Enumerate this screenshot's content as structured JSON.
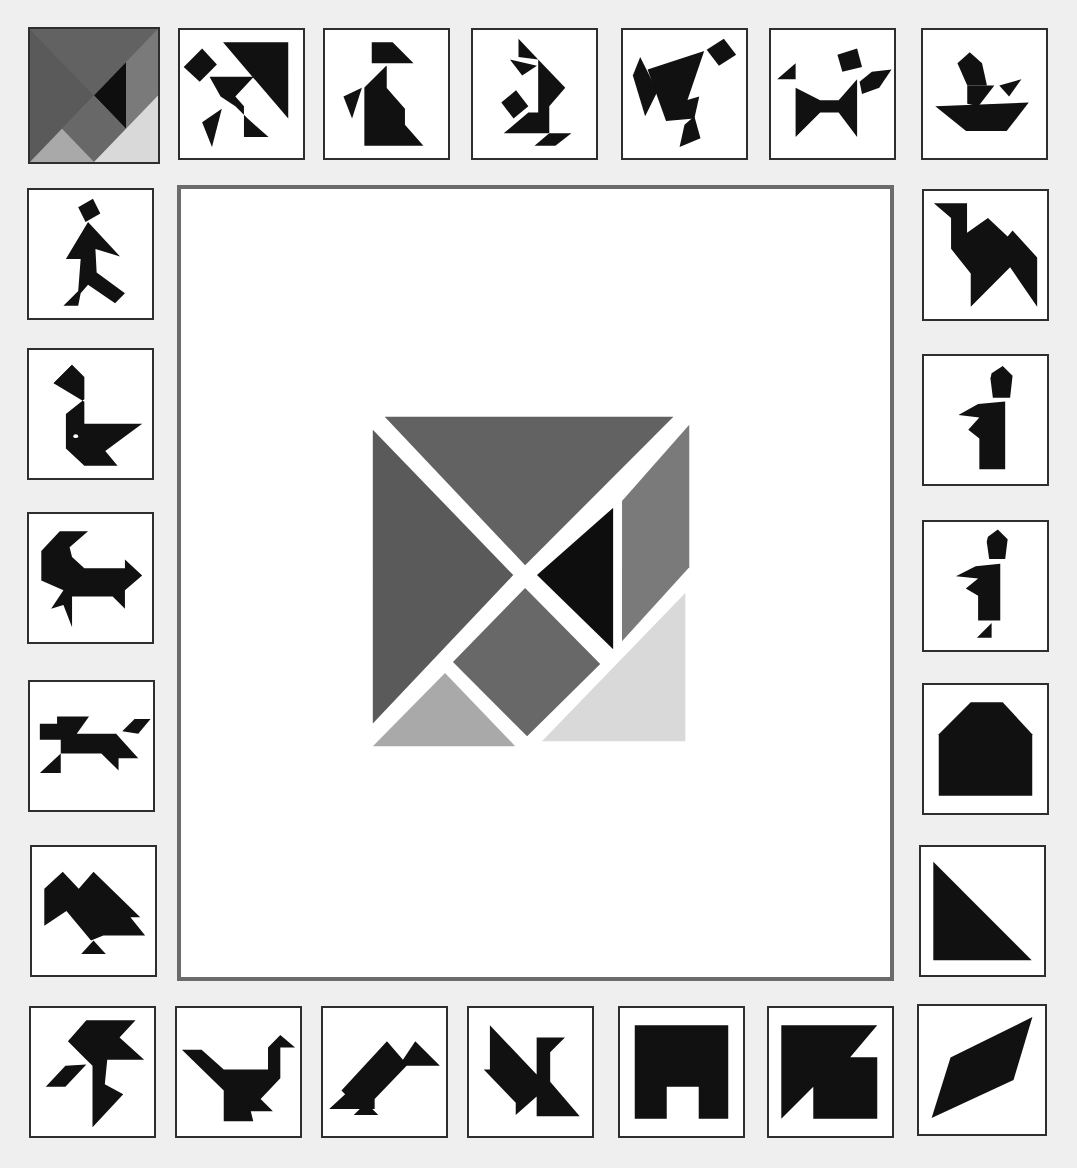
{
  "game": {
    "title": "Tangram Puzzle",
    "board_label": "Tangram square (solved)",
    "colors": {
      "background": "#efefef",
      "tile_bg": "#ffffff",
      "tile_border": "#2e2e2e",
      "board_border": "#6b6b6b",
      "silhouette": "#111111",
      "piece_large_left": "#5a5a5a",
      "piece_large_top": "#626262",
      "piece_parallelogram": "#7a7a7a",
      "piece_square": "#686868",
      "piece_small_black": "#0e0e0e",
      "piece_small_bottom": "#a9a9a9",
      "piece_medium": "#d9d9d9"
    },
    "tiles": [
      {
        "id": "t01",
        "label": "Square (selected)",
        "row": "top"
      },
      {
        "id": "t02",
        "label": "Kicking man",
        "row": "top"
      },
      {
        "id": "t03",
        "label": "Seated woman",
        "row": "top"
      },
      {
        "id": "t04",
        "label": "Kneeling figure",
        "row": "top"
      },
      {
        "id": "t05",
        "label": "Tumbling figure",
        "row": "top"
      },
      {
        "id": "t06",
        "label": "Dancer",
        "row": "top"
      },
      {
        "id": "t07",
        "label": "Boat with man",
        "row": "top"
      },
      {
        "id": "t08",
        "label": "Walking man",
        "row": "left"
      },
      {
        "id": "t09",
        "label": "Swan",
        "row": "left"
      },
      {
        "id": "t10",
        "label": "Goat",
        "row": "left"
      },
      {
        "id": "t11",
        "label": "Running dog",
        "row": "left"
      },
      {
        "id": "t12",
        "label": "Mountains",
        "row": "left"
      },
      {
        "id": "t13",
        "label": "Camel",
        "row": "right"
      },
      {
        "id": "t14",
        "label": "Standing man",
        "row": "right"
      },
      {
        "id": "t15",
        "label": "Standing man with foot",
        "row": "right"
      },
      {
        "id": "t16",
        "label": "House",
        "row": "right"
      },
      {
        "id": "t17",
        "label": "Triangle",
        "row": "right"
      },
      {
        "id": "t18",
        "label": "Bird of prey",
        "row": "bottom"
      },
      {
        "id": "t19",
        "label": "Goose",
        "row": "bottom"
      },
      {
        "id": "t20",
        "label": "Vulture",
        "row": "bottom"
      },
      {
        "id": "t21",
        "label": "Fish",
        "row": "bottom"
      },
      {
        "id": "t22",
        "label": "Gate",
        "row": "bottom"
      },
      {
        "id": "t23",
        "label": "Notched square",
        "row": "bottom"
      },
      {
        "id": "t24",
        "label": "Rhombus",
        "row": "bottom"
      }
    ]
  }
}
